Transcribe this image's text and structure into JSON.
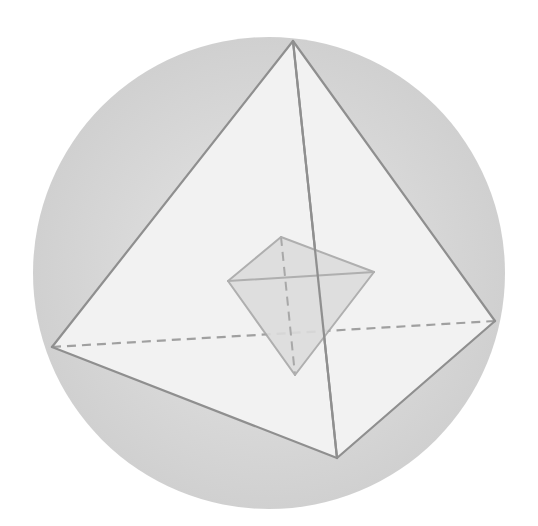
{
  "diagram": {
    "colors": {
      "background": "#ffffff",
      "sphere_center": "#e6e6e6",
      "sphere_edge": "#d0d0d0",
      "outer_face": "#f2f2f2",
      "outer_edge": "#8f8f8f",
      "inner_face": "#dcdcdc",
      "inner_edge": "#a8a8a8",
      "hidden_edge": "#a0a0a0"
    },
    "sphere": {
      "cx": 269,
      "cy": 273,
      "r": 236
    },
    "outer_tetrahedron": {
      "vertices": {
        "top": [
          293,
          41
        ],
        "left": [
          52,
          347
        ],
        "right": [
          495,
          321
        ],
        "bottom": [
          337,
          458
        ]
      },
      "visible_edges": [
        [
          "top",
          "left"
        ],
        [
          "top",
          "right"
        ],
        [
          "top",
          "bottom"
        ],
        [
          "left",
          "bottom"
        ],
        [
          "right",
          "bottom"
        ]
      ],
      "hidden_edges": [
        [
          "left",
          "right"
        ]
      ]
    },
    "inner_tetrahedron": {
      "vertices": {
        "top": [
          281,
          237
        ],
        "left": [
          228,
          281
        ],
        "right": [
          374,
          272
        ],
        "bottom": [
          295,
          375
        ]
      },
      "visible_edges": [
        [
          "top",
          "left"
        ],
        [
          "top",
          "right"
        ],
        [
          "left",
          "right"
        ],
        [
          "left",
          "bottom"
        ],
        [
          "right",
          "bottom"
        ]
      ],
      "hidden_edges": [
        [
          "top",
          "bottom"
        ]
      ]
    }
  }
}
